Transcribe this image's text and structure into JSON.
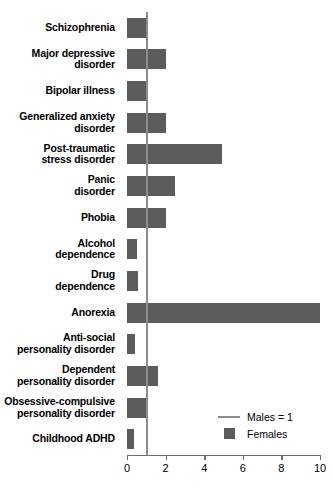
{
  "chart_data": {
    "type": "bar",
    "orientation": "horizontal",
    "title": "",
    "xlabel": "",
    "ylabel": "",
    "xlim": [
      0,
      10
    ],
    "xticks": [
      0,
      2,
      4,
      6,
      8,
      10
    ],
    "xtick_labels": [
      "0",
      "2",
      "4",
      "6",
      "8",
      "10"
    ],
    "grid": false,
    "reference_line": {
      "value": 1,
      "label": "Males = 1",
      "color": "#8c8c8c"
    },
    "series_name": "Females",
    "series_color": "#5c5c5c",
    "categories": [
      "Schizophrenia",
      "Major depressive disorder",
      "Bipolar illness",
      "Generalized anxiety disorder",
      "Post-traumatic stress disorder",
      "Panic disorder",
      "Phobia",
      "Alcohol dependence",
      "Drug dependence",
      "Anorexia",
      "Anti-social personality disorder",
      "Dependent personality disorder",
      "Obsessive-compulsive personality disorder",
      "Childhood ADHD"
    ],
    "category_lines": [
      [
        "Schizophrenia"
      ],
      [
        "Major depressive",
        "disorder"
      ],
      [
        "Bipolar illness"
      ],
      [
        "Generalized anxiety",
        "disorder"
      ],
      [
        "Post-traumatic",
        "stress disorder"
      ],
      [
        "Panic",
        "disorder"
      ],
      [
        "Phobia"
      ],
      [
        "Alcohol",
        "dependence"
      ],
      [
        "Drug",
        "dependence"
      ],
      [
        "Anorexia"
      ],
      [
        "Anti-social",
        "personality disorder"
      ],
      [
        "Dependent",
        "personality disorder"
      ],
      [
        "Obsessive-compulsive",
        "personality disorder"
      ],
      [
        "Childhood ADHD"
      ]
    ],
    "values": [
      1.0,
      2.0,
      1.0,
      2.0,
      4.9,
      2.5,
      2.0,
      0.5,
      0.55,
      10.0,
      0.4,
      1.6,
      1.05,
      0.35
    ],
    "legend": {
      "position": "bottom-right",
      "entries": [
        {
          "label": "Males = 1",
          "marker": "line",
          "color": "#8c8c8c"
        },
        {
          "label": "Females",
          "marker": "square",
          "color": "#5c5c5c"
        }
      ]
    }
  }
}
